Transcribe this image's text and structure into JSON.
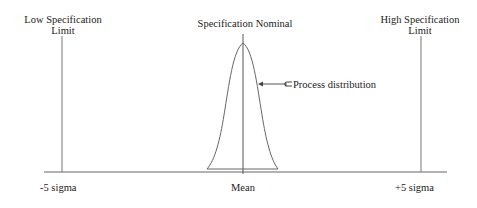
{
  "diagram": {
    "labels": {
      "low_spec": "Low Specification",
      "low_spec_2": "Limit",
      "nominal": "Specification  Nominal",
      "high_spec": "High  Specification",
      "high_spec_2": "Limit",
      "process": "Process  distribution",
      "minus_sigma": "-5  sigma",
      "mean": "Mean",
      "plus_sigma": "+5  sigma"
    },
    "colors": {
      "line": "#555555",
      "text": "#222222",
      "background": "#ffffff"
    }
  }
}
